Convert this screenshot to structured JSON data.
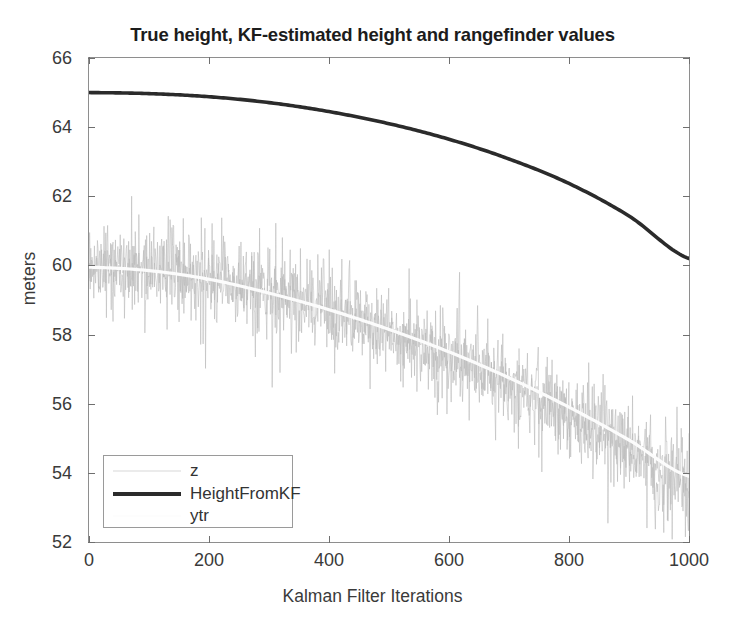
{
  "chart_data": {
    "type": "line",
    "title": "True height, KF-estimated height and rangefinder values",
    "xlabel": "Kalman Filter Iterations",
    "ylabel": "meters",
    "xlim": [
      0,
      1000
    ],
    "ylim": [
      52,
      66
    ],
    "xticks": [
      0,
      200,
      400,
      600,
      800,
      1000
    ],
    "yticks": [
      52,
      54,
      56,
      58,
      60,
      62,
      64,
      66
    ],
    "xtick_labels": [
      "0",
      "200",
      "400",
      "600",
      "800",
      "1000"
    ],
    "ytick_labels": [
      "52",
      "54",
      "56",
      "58",
      "60",
      "62",
      "64",
      "66"
    ],
    "grid": false,
    "legend_position": "lower left",
    "legend": [
      "z",
      "HeightFromKF",
      "ytr"
    ],
    "colors": {
      "z": "#b9b9b9",
      "HeightFromKF": "#2b2b2b",
      "ytr": "#fbfbfb",
      "axis": "#8e8e8e",
      "text": "#3a3a3a",
      "background": "#ffffff"
    },
    "series": [
      {
        "name": "z",
        "style": "noisy-scatter",
        "description": "rangefinder measurements, noisy samples scattered about the true height curve",
        "noise_std": 0.75,
        "x": [
          0,
          100,
          200,
          300,
          400,
          500,
          600,
          700,
          800,
          900,
          1000
        ],
        "values": [
          60.0,
          59.9,
          59.6,
          59.2,
          58.7,
          58.1,
          57.4,
          56.6,
          55.7,
          54.7,
          53.6
        ]
      },
      {
        "name": "HeightFromKF",
        "style": "thick-solid",
        "description": "Kalman-filter estimated height, smooth downward-curving parabola",
        "x": [
          0,
          100,
          200,
          300,
          400,
          500,
          600,
          700,
          800,
          900,
          1000
        ],
        "values": [
          65.0,
          64.97,
          64.88,
          64.71,
          64.45,
          64.1,
          63.65,
          63.08,
          62.37,
          61.43,
          60.2
        ]
      },
      {
        "name": "ytr",
        "style": "thin-light",
        "description": "true height trajectory, very light line running through the centre of the noise band",
        "x": [
          0,
          100,
          200,
          300,
          400,
          500,
          600,
          700,
          800,
          900,
          1000
        ],
        "values": [
          59.95,
          59.85,
          59.6,
          59.2,
          58.72,
          58.15,
          57.5,
          56.75,
          55.9,
          54.95,
          53.9
        ]
      }
    ]
  },
  "axes": {
    "yticks": [
      {
        "label": "66",
        "value": 66
      },
      {
        "label": "64",
        "value": 64
      },
      {
        "label": "62",
        "value": 62
      },
      {
        "label": "60",
        "value": 60
      },
      {
        "label": "58",
        "value": 58
      },
      {
        "label": "56",
        "value": 56
      },
      {
        "label": "54",
        "value": 54
      },
      {
        "label": "52",
        "value": 52
      }
    ],
    "xticks": [
      {
        "label": "0",
        "value": 0
      },
      {
        "label": "200",
        "value": 200
      },
      {
        "label": "400",
        "value": 400
      },
      {
        "label": "600",
        "value": 600
      },
      {
        "label": "800",
        "value": 800
      },
      {
        "label": "1000",
        "value": 1000
      }
    ]
  },
  "legend": {
    "entries": [
      {
        "label": "z"
      },
      {
        "label": "HeightFromKF"
      },
      {
        "label": "ytr"
      }
    ]
  }
}
